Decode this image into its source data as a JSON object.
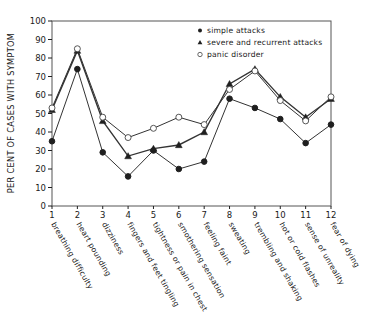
{
  "chart_data": {
    "type": "line",
    "title": "",
    "xlabel": "",
    "ylabel": "PER CENT OF CASES WITH SYMPTOM",
    "ylim": [
      0,
      100
    ],
    "yticks": [
      0,
      10,
      20,
      30,
      40,
      50,
      60,
      70,
      80,
      90,
      100
    ],
    "x": [
      1,
      2,
      3,
      4,
      5,
      6,
      7,
      8,
      9,
      10,
      11,
      12
    ],
    "categories": [
      "breathing difficulty",
      "heart pounding",
      "dizziness",
      "fingers and feet tingling",
      "tightness or pain in chest",
      "smothering sensation",
      "feeling faint",
      "sweating",
      "trembling and shaking",
      "hot or cold flashes",
      "sense of unreality",
      "fear of dying"
    ],
    "series": [
      {
        "name": "simple attacks",
        "marker": "filled-circle",
        "values": [
          35,
          74,
          29,
          16,
          30,
          20,
          24,
          58,
          53,
          47,
          34,
          44
        ]
      },
      {
        "name": "severe and recurrent attacks",
        "marker": "filled-triangle",
        "values": [
          52,
          84,
          46,
          27,
          31,
          33,
          40,
          66,
          74,
          59,
          48,
          58
        ]
      },
      {
        "name": "panic disorder",
        "marker": "open-circle",
        "values": [
          53,
          85,
          48,
          37,
          42,
          48,
          44,
          63,
          73,
          57,
          46,
          59
        ]
      }
    ],
    "legend_position": "upper right (inside plot)",
    "grid": false
  }
}
